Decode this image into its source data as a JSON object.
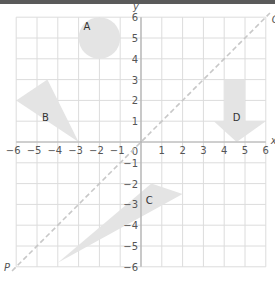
{
  "diagram": {
    "type": "coordinate-grid",
    "axes": {
      "x_label": "x",
      "y_label": "y",
      "x_ticks": [
        "-6",
        "-5",
        "-4",
        "-3",
        "-2",
        "-1",
        "0",
        "1",
        "2",
        "3",
        "4",
        "5",
        "6"
      ],
      "y_ticks": [
        "6",
        "5",
        "4",
        "3",
        "2",
        "1",
        "0",
        "-1",
        "-2",
        "-3",
        "-4",
        "-5",
        "-6"
      ],
      "range": [
        -6,
        6
      ]
    },
    "line": {
      "start_label": "P",
      "end_label": "Q",
      "style": "dashed",
      "equation": "y = x"
    },
    "shapes": [
      {
        "label": "A",
        "kind": "circle",
        "center": [
          -2,
          5
        ],
        "radius": 1
      },
      {
        "label": "B",
        "kind": "triangle",
        "vertices": [
          [
            -6,
            2
          ],
          [
            -4.5,
            3
          ],
          [
            -3,
            0
          ]
        ]
      },
      {
        "label": "C",
        "kind": "triangle",
        "vertices": [
          [
            -4,
            -5.8
          ],
          [
            0.5,
            -2
          ],
          [
            2,
            -2.5
          ]
        ]
      },
      {
        "label": "D",
        "kind": "arrow-down",
        "vertices": [
          [
            4,
            3
          ],
          [
            5,
            3
          ],
          [
            5,
            1
          ],
          [
            6,
            1
          ],
          [
            4.6,
            0
          ],
          [
            3.5,
            1
          ],
          [
            4,
            1
          ]
        ]
      }
    ],
    "colors": {
      "grid": "#d9d9d9",
      "axis": "#b0b0b0",
      "shape_fill": "#e4e4e4",
      "dashed_line": "#c8c8c8",
      "text": "#555555",
      "top_bar": "#5a5a5a"
    }
  }
}
